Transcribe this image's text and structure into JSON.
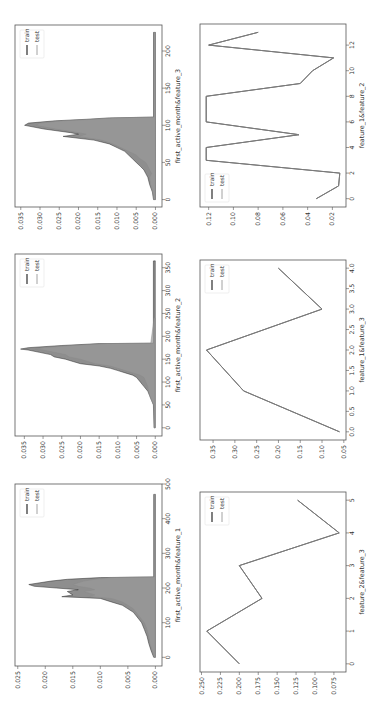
{
  "figure": {
    "legend": {
      "train": "train",
      "test": "test"
    },
    "colors": {
      "frame": "#555555",
      "train": "#2b2b2b",
      "test": "#8a8a8a",
      "fill": "#7a7a7a",
      "text": "#333333"
    }
  },
  "chart_data": [
    {
      "id": "density_feature_3",
      "type": "area",
      "xlabel": "first_active_month&feature_3",
      "ylabel": "",
      "xlim": [
        -10,
        235
      ],
      "ylim": [
        -0.0017,
        0.0365
      ],
      "xticks": [
        0,
        50,
        100,
        150,
        200
      ],
      "yticks": [
        0.0,
        0.005,
        0.01,
        0.015,
        0.02,
        0.025,
        0.03,
        0.035
      ],
      "ytick_labels": [
        "0.000",
        "0.005",
        "0.010",
        "0.015",
        "0.020",
        "0.025",
        "0.030",
        "0.035"
      ],
      "legend_position": "upper left",
      "series": [
        {
          "name": "train",
          "x": [
            0,
            10,
            20,
            30,
            35,
            40,
            45,
            50,
            55,
            60,
            65,
            70,
            75,
            80,
            85,
            88,
            90,
            95,
            100,
            103,
            106,
            108,
            110,
            111,
            225
          ],
          "values": [
            0.0005,
            0.0008,
            0.0015,
            0.002,
            0.0025,
            0.003,
            0.004,
            0.005,
            0.006,
            0.007,
            0.008,
            0.01,
            0.012,
            0.016,
            0.024,
            0.02,
            0.022,
            0.029,
            0.034,
            0.033,
            0.026,
            0.018,
            0.012,
            0.0005,
            0.0005
          ]
        },
        {
          "name": "test",
          "x": [
            0,
            10,
            20,
            30,
            35,
            40,
            45,
            50,
            55,
            60,
            65,
            70,
            75,
            80,
            85,
            88,
            90,
            95,
            100,
            103,
            106,
            108,
            110,
            111,
            225
          ],
          "values": [
            0.0004,
            0.0007,
            0.0013,
            0.0015,
            0.001,
            0.0015,
            0.002,
            0.0025,
            0.004,
            0.005,
            0.007,
            0.009,
            0.011,
            0.014,
            0.02,
            0.018,
            0.02,
            0.026,
            0.031,
            0.03,
            0.024,
            0.016,
            0.011,
            0.0004,
            0.0004
          ]
        }
      ]
    },
    {
      "id": "line_feature_1_feature_2",
      "type": "line",
      "xlabel": "feature_1&feature_2",
      "ylabel": "",
      "xlim": [
        -0.65,
        13.65
      ],
      "ylim": [
        0.009,
        0.127
      ],
      "xticks": [
        0,
        2,
        4,
        6,
        8,
        10,
        12
      ],
      "yticks": [
        0.02,
        0.04,
        0.06,
        0.08,
        0.1,
        0.12
      ],
      "ytick_labels": [
        "0.02",
        "0.04",
        "0.06",
        "0.08",
        "0.10",
        "0.12"
      ],
      "legend_position": "lower left",
      "series": [
        {
          "name": "train",
          "x": [
            0,
            1,
            2,
            3,
            4,
            5,
            6,
            7,
            8,
            9,
            10,
            11,
            12,
            13
          ],
          "values": [
            0.033,
            0.015,
            0.014,
            0.122,
            0.122,
            0.047,
            0.122,
            0.122,
            0.122,
            0.046,
            0.036,
            0.019,
            0.12,
            0.08
          ]
        },
        {
          "name": "test",
          "x": [
            0,
            1,
            2,
            3,
            4,
            5,
            6,
            7,
            8,
            9,
            10,
            11,
            12,
            13
          ],
          "values": [
            0.033,
            0.015,
            0.014,
            0.122,
            0.122,
            0.047,
            0.122,
            0.122,
            0.122,
            0.046,
            0.036,
            0.019,
            0.12,
            0.08
          ]
        }
      ]
    },
    {
      "id": "density_feature_2",
      "type": "area",
      "xlabel": "first_active_month&feature_2",
      "ylabel": "",
      "xlim": [
        -18,
        380
      ],
      "ylim": [
        -0.0018,
        0.0375
      ],
      "xticks": [
        0,
        50,
        100,
        150,
        200,
        250,
        300,
        350
      ],
      "yticks": [
        0.0,
        0.005,
        0.01,
        0.015,
        0.02,
        0.025,
        0.03,
        0.035
      ],
      "ytick_labels": [
        "0.000",
        "0.005",
        "0.010",
        "0.015",
        "0.020",
        "0.025",
        "0.030",
        "0.035"
      ],
      "legend_position": "upper left",
      "series": [
        {
          "name": "train",
          "x": [
            0,
            50,
            60,
            70,
            80,
            90,
            100,
            110,
            115,
            120,
            125,
            130,
            135,
            140,
            145,
            150,
            155,
            160,
            165,
            170,
            172,
            175,
            180,
            184,
            185,
            365
          ],
          "values": [
            0.0003,
            0.0005,
            0.001,
            0.0015,
            0.002,
            0.003,
            0.004,
            0.005,
            0.006,
            0.008,
            0.01,
            0.012,
            0.015,
            0.02,
            0.022,
            0.024,
            0.027,
            0.028,
            0.031,
            0.034,
            0.036,
            0.034,
            0.025,
            0.015,
            0.0005,
            0.0005
          ]
        },
        {
          "name": "test",
          "x": [
            0,
            50,
            60,
            70,
            80,
            90,
            100,
            110,
            115,
            120,
            125,
            130,
            135,
            140,
            145,
            150,
            155,
            160,
            165,
            170,
            172,
            175,
            180,
            184,
            185,
            240
          ],
          "values": [
            0.0003,
            0.0004,
            0.001,
            0.0015,
            0.0018,
            0.002,
            0.0025,
            0.003,
            0.004,
            0.006,
            0.008,
            0.01,
            0.012,
            0.016,
            0.018,
            0.02,
            0.023,
            0.024,
            0.027,
            0.03,
            0.032,
            0.03,
            0.022,
            0.013,
            0.0012,
            0.0003
          ]
        }
      ]
    },
    {
      "id": "line_feature_1_feature_3",
      "type": "line",
      "xlabel": "feature_1&feature_3",
      "ylabel": "",
      "xlim": [
        -0.2,
        4.2
      ],
      "ylim": [
        0.045,
        0.38
      ],
      "xticks": [
        0.0,
        0.5,
        1.0,
        1.5,
        2.0,
        2.5,
        3.0,
        3.5,
        4.0
      ],
      "xtick_labels": [
        "0.0",
        "0.5",
        "1.0",
        "1.5",
        "2.0",
        "2.5",
        "3.0",
        "3.5",
        "4.0"
      ],
      "yticks": [
        0.05,
        0.1,
        0.15,
        0.2,
        0.25,
        0.3,
        0.35
      ],
      "ytick_labels": [
        "0.05",
        "0.10",
        "0.15",
        "0.20",
        "0.25",
        "0.30",
        "0.35"
      ],
      "legend_position": "upper left",
      "series": [
        {
          "name": "train",
          "x": [
            0,
            1,
            2,
            3,
            4
          ],
          "values": [
            0.06,
            0.28,
            0.365,
            0.1,
            0.2
          ]
        },
        {
          "name": "test",
          "x": [
            0,
            1,
            2,
            3,
            4
          ],
          "values": [
            0.06,
            0.28,
            0.365,
            0.1,
            0.2
          ]
        }
      ]
    },
    {
      "id": "density_feature_1",
      "type": "area",
      "xlabel": "first_active_month&feature_1",
      "ylabel": "",
      "xlim": [
        -25,
        500
      ],
      "ylim": [
        -0.0012,
        0.0255
      ],
      "xticks": [
        0,
        100,
        200,
        300,
        400,
        500
      ],
      "yticks": [
        0.0,
        0.005,
        0.01,
        0.015,
        0.02,
        0.025
      ],
      "ytick_labels": [
        "0.000",
        "0.005",
        "0.010",
        "0.015",
        "0.020",
        "0.025"
      ],
      "legend_position": "upper left",
      "series": [
        {
          "name": "train",
          "x": [
            0,
            20,
            40,
            60,
            80,
            100,
            110,
            120,
            130,
            140,
            150,
            160,
            170,
            175,
            180,
            190,
            195,
            200,
            205,
            210,
            215,
            220,
            225,
            230,
            232,
            470
          ],
          "values": [
            0.0003,
            0.0008,
            0.0012,
            0.0015,
            0.002,
            0.0025,
            0.003,
            0.0035,
            0.004,
            0.005,
            0.006,
            0.008,
            0.01,
            0.017,
            0.015,
            0.016,
            0.014,
            0.018,
            0.022,
            0.023,
            0.021,
            0.019,
            0.016,
            0.01,
            0.0003,
            0.0003
          ]
        },
        {
          "name": "test",
          "x": [
            0,
            20,
            40,
            60,
            80,
            100,
            110,
            120,
            130,
            140,
            150,
            160,
            170,
            175,
            180,
            190,
            195,
            200,
            205,
            210,
            215,
            220,
            225,
            230,
            232,
            470
          ],
          "values": [
            0.0002,
            0.0006,
            0.001,
            0.0012,
            0.0015,
            0.002,
            0.0025,
            0.003,
            0.0035,
            0.004,
            0.005,
            0.006,
            0.008,
            0.012,
            0.011,
            0.013,
            0.011,
            0.012,
            0.014,
            0.015,
            0.014,
            0.013,
            0.011,
            0.008,
            0.0002,
            0.0002
          ]
        }
      ]
    },
    {
      "id": "line_feature_2_feature_3",
      "type": "line",
      "xlabel": "feature_2&feature_3",
      "ylabel": "",
      "xlim": [
        -0.25,
        5.25
      ],
      "ylim": [
        0.059,
        0.252
      ],
      "xticks": [
        0,
        1,
        2,
        3,
        4,
        5
      ],
      "yticks": [
        0.075,
        0.1,
        0.125,
        0.15,
        0.175,
        0.2,
        0.225,
        0.25
      ],
      "ytick_labels": [
        "0.075",
        "0.100",
        "0.125",
        "0.150",
        "0.175",
        "0.200",
        "0.225",
        "0.250"
      ],
      "legend_position": "upper left",
      "series": [
        {
          "name": "train",
          "x": [
            0,
            1,
            2,
            3,
            4,
            5
          ],
          "values": [
            0.2,
            0.243,
            0.17,
            0.2,
            0.068,
            0.123
          ]
        },
        {
          "name": "test",
          "x": [
            0,
            1,
            2,
            3,
            4,
            5
          ],
          "values": [
            0.2,
            0.243,
            0.17,
            0.2,
            0.068,
            0.123
          ]
        }
      ]
    }
  ],
  "layout": {
    "panels": [
      {
        "chart": 0,
        "frame": {
          "x": 15,
          "y": 25,
          "w": 147,
          "h": 182
        }
      },
      {
        "chart": 1,
        "frame": {
          "x": 200,
          "y": 24,
          "w": 146,
          "h": 183
        }
      },
      {
        "chart": 2,
        "frame": {
          "x": 15,
          "y": 254,
          "w": 147,
          "h": 182
        }
      },
      {
        "chart": 3,
        "frame": {
          "x": 200,
          "y": 260,
          "w": 146,
          "h": 180
        }
      },
      {
        "chart": 4,
        "frame": {
          "x": 15,
          "y": 484,
          "w": 147,
          "h": 182
        }
      },
      {
        "chart": 5,
        "frame": {
          "x": 200,
          "y": 492,
          "w": 146,
          "h": 180
        }
      }
    ]
  }
}
